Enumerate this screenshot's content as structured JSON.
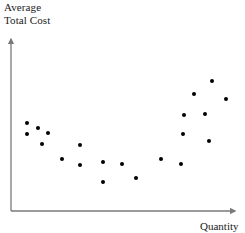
{
  "chart_data": {
    "type": "scatter",
    "title": "",
    "ylabel": "Average\nTotal Cost",
    "xlabel": "Quantity",
    "grid": false,
    "legend": null,
    "axis_style": "arrow",
    "xlim": [
      0,
      245
    ],
    "ylim": [
      0,
      233
    ],
    "marker_color": "#000000",
    "axis_color": "#7a7a7a",
    "points_px": [
      {
        "x": 27,
        "y": 123
      },
      {
        "x": 38,
        "y": 128
      },
      {
        "x": 27,
        "y": 134
      },
      {
        "x": 48,
        "y": 133
      },
      {
        "x": 42,
        "y": 144
      },
      {
        "x": 80,
        "y": 145
      },
      {
        "x": 62,
        "y": 159
      },
      {
        "x": 80,
        "y": 165
      },
      {
        "x": 103,
        "y": 162
      },
      {
        "x": 103,
        "y": 182
      },
      {
        "x": 122,
        "y": 164
      },
      {
        "x": 136,
        "y": 178
      },
      {
        "x": 161,
        "y": 159
      },
      {
        "x": 181,
        "y": 164
      },
      {
        "x": 183,
        "y": 134
      },
      {
        "x": 184,
        "y": 115
      },
      {
        "x": 205,
        "y": 114
      },
      {
        "x": 209,
        "y": 141
      },
      {
        "x": 194,
        "y": 94
      },
      {
        "x": 212,
        "y": 81
      },
      {
        "x": 226,
        "y": 99
      }
    ],
    "x": [
      27,
      38,
      27,
      48,
      42,
      80,
      62,
      80,
      103,
      103,
      122,
      136,
      161,
      181,
      183,
      184,
      205,
      209,
      194,
      212,
      226
    ],
    "y": [
      88,
      83,
      77,
      78,
      67,
      66,
      52,
      46,
      49,
      29,
      47,
      33,
      52,
      47,
      77,
      96,
      97,
      70,
      117,
      130,
      112
    ],
    "n_points": 21
  },
  "axes": {
    "origin": {
      "x": 11,
      "y": 211
    },
    "y_top": {
      "x": 11,
      "y": 36
    },
    "x_right": {
      "x": 238,
      "y": 211
    }
  }
}
